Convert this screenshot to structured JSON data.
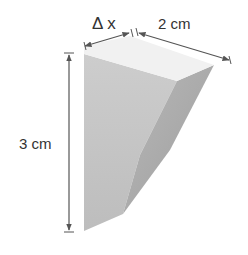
{
  "diagram": {
    "type": "solid-wedge-dimensioned",
    "labels": {
      "delta_x": "Δ x",
      "width": "2 cm",
      "height": "3 cm"
    },
    "colors": {
      "top_face": "#f2f2f2",
      "front_face": "#c4c4c4",
      "side_face": "#a9a9a9",
      "dimension_line": "#555555"
    }
  }
}
